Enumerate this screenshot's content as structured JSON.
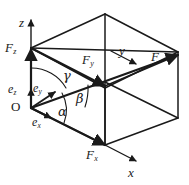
{
  "figure": {
    "kind": "vector-decomposition-3d",
    "stroke_color": "#1a1a1a",
    "background_color": "#ffffff"
  },
  "axes": [
    {
      "id": "z",
      "label": "z",
      "x": 19,
      "y": 16
    },
    {
      "id": "y",
      "label": "y",
      "x": 119,
      "y": 44
    },
    {
      "id": "x",
      "label": "x",
      "x": 128,
      "y": 166
    }
  ],
  "origin": {
    "label": "O",
    "x": 11,
    "y": 100
  },
  "components": [
    {
      "id": "Fz",
      "base": "F",
      "sub": "z",
      "x": 5,
      "y": 41
    },
    {
      "id": "Fy",
      "base": "F",
      "sub": "y",
      "x": 82,
      "y": 53
    },
    {
      "id": "Fx",
      "base": "F",
      "sub": "x",
      "x": 86,
      "y": 148
    },
    {
      "id": "F",
      "base": "F",
      "sub": "",
      "x": 151,
      "y": 50
    }
  ],
  "unit_vectors": [
    {
      "id": "ez",
      "base": "e",
      "sub": "z",
      "x": 8,
      "y": 83
    },
    {
      "id": "ey",
      "base": "e",
      "sub": "y",
      "x": 33,
      "y": 82
    },
    {
      "id": "ex",
      "base": "e",
      "sub": "x",
      "x": 32,
      "y": 116
    }
  ],
  "angles": [
    {
      "id": "alpha",
      "label": "α",
      "x": 58,
      "y": 105
    },
    {
      "id": "beta",
      "label": "β",
      "x": 76,
      "y": 92
    },
    {
      "id": "gamma",
      "label": "γ",
      "x": 63,
      "y": 69
    }
  ]
}
